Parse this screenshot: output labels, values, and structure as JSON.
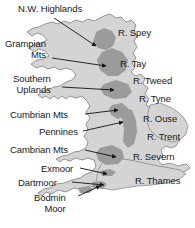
{
  "figure": {
    "width": 195,
    "height": 228,
    "background_color": "#ffffff"
  },
  "colors": {
    "background": "#ffffff",
    "lowland_fill": "#d4d4d4",
    "upland_fill": "#9b9b9b",
    "coastline_stroke": "#6e6e6e",
    "leader_line": "#111111",
    "text": "#1a1a1a"
  },
  "upland_labels": [
    {
      "id": "nw-highlands",
      "text": "N.W. Highlands",
      "lines": [
        "N.W. Highlands"
      ],
      "x": 18,
      "y": 4,
      "align": "left"
    },
    {
      "id": "grampian-mts",
      "text": "Grampian Mts",
      "lines": [
        "Grampian",
        "Mts"
      ],
      "x": 5,
      "y": 39,
      "align": "left"
    },
    {
      "id": "southern-uplands",
      "text": "Southern Uplands",
      "lines": [
        "Southern",
        "Uplands"
      ],
      "x": 13,
      "y": 74,
      "align": "left"
    },
    {
      "id": "cumbrian-mts",
      "text": "Cumbrian Mts",
      "lines": [
        "Cumbrian Mts"
      ],
      "x": 10,
      "y": 110,
      "align": "left"
    },
    {
      "id": "pennines",
      "text": "Pennines",
      "lines": [
        "Pennines"
      ],
      "x": 39,
      "y": 127,
      "align": "left"
    },
    {
      "id": "cambrian-mts",
      "text": "Cambrian Mts",
      "lines": [
        "Cambrian Mts"
      ],
      "x": 10,
      "y": 145,
      "align": "left"
    },
    {
      "id": "exmoor",
      "text": "Exmoor",
      "lines": [
        "Exmoor"
      ],
      "x": 41,
      "y": 164,
      "align": "left"
    },
    {
      "id": "dartmoor",
      "text": "Dartmoor",
      "lines": [
        "Dartmoor"
      ],
      "x": 18,
      "y": 178,
      "align": "left"
    },
    {
      "id": "bodmin-moor",
      "text": "Bodmin Moor",
      "lines": [
        "Bodmin",
        "Moor"
      ],
      "x": 34,
      "y": 193,
      "align": "left"
    }
  ],
  "river_labels": [
    {
      "id": "r-spey",
      "text": "R. Spey",
      "x": 118,
      "y": 28
    },
    {
      "id": "r-tay",
      "text": "R. Tay",
      "x": 120,
      "y": 59
    },
    {
      "id": "r-tweed",
      "text": "R. Tweed",
      "x": 133,
      "y": 76
    },
    {
      "id": "r-tyne",
      "text": "R. Tyne",
      "x": 139,
      "y": 94
    },
    {
      "id": "r-ouse",
      "text": "R. Ouse",
      "x": 143,
      "y": 114
    },
    {
      "id": "r-trent",
      "text": "R. Trent",
      "x": 147,
      "y": 132
    },
    {
      "id": "r-severn",
      "text": "R. Severn",
      "x": 133,
      "y": 152
    },
    {
      "id": "r-thames",
      "text": "R. Thames",
      "x": 135,
      "y": 176
    }
  ],
  "leader_lines": [
    {
      "id": "leader-nw-highlands",
      "from_x": 54,
      "from_y": 18,
      "to_x": 96,
      "to_y": 46
    },
    {
      "id": "leader-grampian-mts",
      "from_x": 52,
      "from_y": 58,
      "to_x": 106,
      "to_y": 66
    },
    {
      "id": "leader-southern-uplands",
      "from_x": 62,
      "from_y": 87,
      "to_x": 114,
      "to_y": 90
    },
    {
      "id": "leader-cumbrian-mts",
      "from_x": 85,
      "from_y": 114,
      "to_x": 118,
      "to_y": 110
    },
    {
      "id": "leader-pennines",
      "from_x": 83,
      "from_y": 131,
      "to_x": 123,
      "to_y": 122
    },
    {
      "id": "leader-cambrian-mts",
      "from_x": 85,
      "from_y": 150,
      "to_x": 116,
      "to_y": 157
    },
    {
      "id": "leader-exmoor",
      "from_x": 80,
      "from_y": 168,
      "to_x": 107,
      "to_y": 174
    },
    {
      "id": "leader-dartmoor",
      "from_x": 72,
      "from_y": 182,
      "to_x": 104,
      "to_y": 185
    },
    {
      "id": "leader-bodmin-moor",
      "from_x": 78,
      "from_y": 196,
      "to_x": 100,
      "to_y": 186
    }
  ]
}
